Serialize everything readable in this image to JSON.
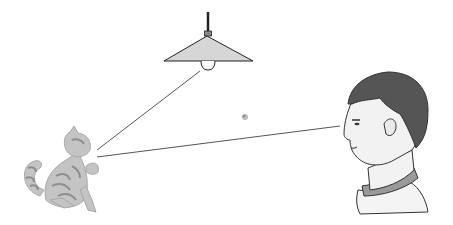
{
  "diagram": {
    "elements": [
      {
        "id": "lamp",
        "label": "Hanging lamp with light bulb"
      },
      {
        "id": "cat",
        "label": "Cat (grey tabby) looking up"
      },
      {
        "id": "person",
        "label": "Boy profile facing left"
      },
      {
        "id": "dust",
        "label": "Small particle in air"
      }
    ],
    "rays": [
      {
        "from": "lamp",
        "to": "cat",
        "label": "Light ray from lamp to cat"
      },
      {
        "from": "cat",
        "to": "person",
        "label": "Reflected light ray from cat to eye"
      }
    ],
    "colors": {
      "background": "#ffffff",
      "lampShade": "#d6d6d6",
      "outline": "#333333",
      "hair": "#555555",
      "skin": "#f2f2f2",
      "collar": "#9a9a9a",
      "cat": "#b5b5b5",
      "ray": "#555555"
    }
  }
}
